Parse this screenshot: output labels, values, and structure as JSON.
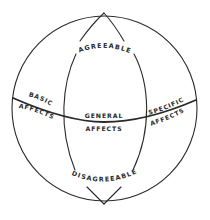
{
  "diagram": {
    "type": "sphere-of-affects",
    "labels": {
      "top": "AGREEABLE",
      "bottom": "DISAGREEABLE",
      "left_line1": "BASIC",
      "left_line2": "AFFECTS",
      "center_line1": "GENERAL",
      "center_line2": "AFFECTS",
      "right_line1": "SPECIFIC",
      "right_line2": "AFFECTS"
    },
    "colors": {
      "line": "#2a2a2a",
      "background": "#ffffff"
    }
  }
}
